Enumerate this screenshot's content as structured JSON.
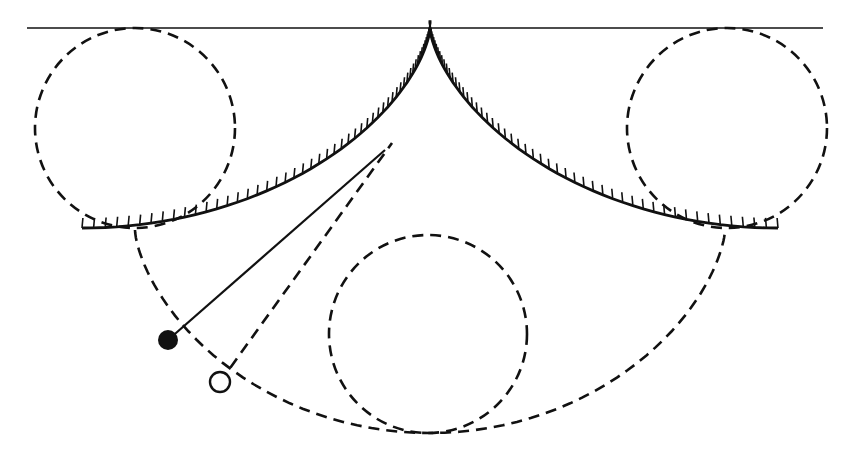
{
  "diagram": {
    "colors": {
      "ink": "#111111",
      "background": "#ffffff"
    },
    "ceiling": {
      "x1": 27,
      "x2": 823,
      "y": 28
    },
    "cusp": {
      "x": 430,
      "y": 28
    },
    "generating_circles": [
      {
        "name": "left-generating-circle",
        "cx": 135,
        "cy": 128,
        "r": 100
      },
      {
        "name": "right-generating-circle",
        "cx": 727,
        "cy": 128,
        "r": 100
      },
      {
        "name": "bottom-generating-circle",
        "cx": 428,
        "cy": 334,
        "r": 99
      }
    ],
    "bob_filled": {
      "cx": 168,
      "cy": 340,
      "r": 10
    },
    "bob_open": {
      "cx": 220,
      "cy": 382,
      "r": 10
    },
    "string_tangent_point": {
      "x": 385,
      "y": 150
    },
    "open_string_tangent_point": {
      "x": 392,
      "y": 143
    }
  }
}
